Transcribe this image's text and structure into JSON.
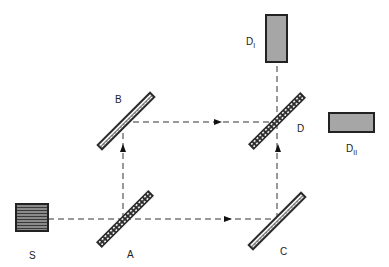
{
  "diagram": {
    "source": {
      "label": "S",
      "x": 16,
      "y": 204,
      "w": 32,
      "h": 27
    },
    "mirrors": [
      {
        "id": "A",
        "label": "A",
        "cx": 125,
        "cy": 219,
        "type": "beam-splitter"
      },
      {
        "id": "B",
        "label": "B",
        "cx": 125,
        "cy": 121,
        "type": "mirror"
      },
      {
        "id": "C",
        "label": "C",
        "cx": 277,
        "cy": 221,
        "type": "mirror"
      },
      {
        "id": "D",
        "label": "D",
        "cx": 277,
        "cy": 121,
        "type": "beam-splitter"
      }
    ],
    "detectors": [
      {
        "id": "DI",
        "label_main": "D",
        "label_sub": "I",
        "x": 266,
        "y": 15,
        "w": 21,
        "h": 47
      },
      {
        "id": "DII",
        "label_main": "D",
        "label_sub": "II",
        "x": 329,
        "y": 113,
        "w": 45,
        "h": 19
      }
    ],
    "colors": {
      "beam": "#333333",
      "mirror": "#2a2a2a",
      "detector_fill": "#a6a6a6",
      "source_stripe": "#555555"
    }
  }
}
